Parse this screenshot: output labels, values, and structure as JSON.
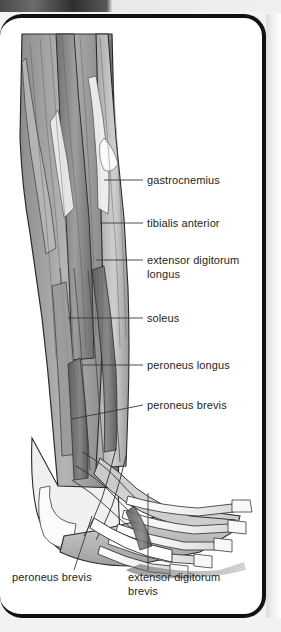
{
  "figure": {
    "view": "lateral",
    "style": "grayscale anatomical illustration",
    "background_color": "#ffffff",
    "border_color": "#111111",
    "text_color": "#231f20"
  },
  "labels": {
    "right": [
      {
        "id": "gastrocnemius",
        "text": "gastrocnemius",
        "x": 147,
        "y": 170,
        "leader_from_x": 104,
        "leader_to_x": 143,
        "leader_y": 176
      },
      {
        "id": "tibialis-anterior",
        "text": "tibialis anterior",
        "x": 147,
        "y": 213,
        "leader_from_x": 100,
        "leader_to_x": 143,
        "leader_y": 219
      },
      {
        "id": "extensor-digitorum-longus",
        "text": "extensor digitorum",
        "text2": "longus",
        "x": 147,
        "y": 250,
        "leader_from_x": 96,
        "leader_to_x": 143,
        "leader_y": 256
      },
      {
        "id": "soleus",
        "text": "soleus",
        "x": 147,
        "y": 308,
        "leader_from_x": 68,
        "leader_to_x": 143,
        "leader_y": 314
      },
      {
        "id": "peroneus-longus",
        "text": "peroneus longus",
        "x": 147,
        "y": 355,
        "leader_from_x": 82,
        "leader_to_x": 143,
        "leader_y": 361
      },
      {
        "id": "peroneus-brevis",
        "text": "peroneus brevis",
        "x": 147,
        "y": 395,
        "leader_from_x": 72,
        "leader_to_x": 143,
        "leader_y": 401
      }
    ],
    "bottom": [
      {
        "id": "peroneus-brevis-foot",
        "text": "peroneus brevis",
        "x": 12,
        "y": 572,
        "leader_x1": 92,
        "leader_y1": 512,
        "leader_x2": 74,
        "leader_y2": 566
      },
      {
        "id": "extensor-digitorum-brevis",
        "text": "extensor digitorum",
        "text2": "brevis",
        "x": 128,
        "y": 572,
        "leader_x1": 148,
        "leader_y1": 489,
        "leader_x2": 148,
        "leader_y2": 566
      }
    ]
  },
  "palette": {
    "muscle_dark": "#6e6e6e",
    "muscle_mid": "#8e8e8e",
    "muscle_light": "#c9c9c9",
    "tendon": "#f4f4f4",
    "bone": "#fbfbfb",
    "outline": "#2a2a2a",
    "leader": "#3a3a3a"
  }
}
